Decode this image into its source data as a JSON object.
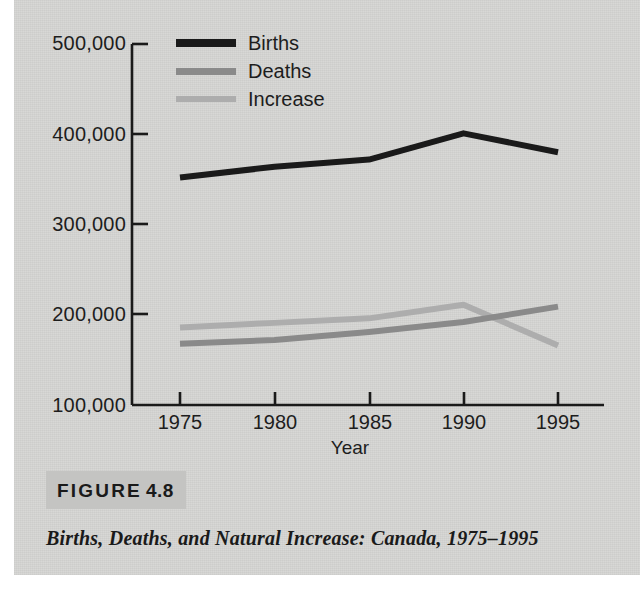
{
  "figure": {
    "tag_word": "FIGURE",
    "tag_number": "4.8",
    "caption": "Births, Deaths, and Natural Increase: Canada, 1975–1995"
  },
  "chart_data": {
    "type": "line",
    "title": "",
    "xlabel": "Year",
    "ylabel": "",
    "x": [
      1975,
      1980,
      1985,
      1990,
      1995
    ],
    "xtick_labels": [
      "1975",
      "1980",
      "1985",
      "1990",
      "1995"
    ],
    "ytick_labels": [
      "500,000",
      "400,000",
      "300,000",
      "200,000",
      "100,000"
    ],
    "ytick_values": [
      500000,
      400000,
      300000,
      200000,
      100000
    ],
    "ylim": [
      100000,
      500000
    ],
    "xlim": [
      1975,
      1995
    ],
    "grid": false,
    "legend_position": "top-center",
    "series": [
      {
        "name": "Births",
        "color": "#1a1a1a",
        "values": [
          352000,
          364000,
          372000,
          401000,
          380000
        ]
      },
      {
        "name": "Deaths",
        "color": "#8a8a8a",
        "values": [
          168000,
          172000,
          181000,
          192000,
          209000
        ]
      },
      {
        "name": "Increase",
        "color": "#adadad",
        "values": [
          186000,
          191000,
          196000,
          211000,
          166000
        ]
      }
    ]
  },
  "colors": {
    "page_background": "#d6d6d4",
    "axis": "#1a1a1a",
    "text": "#1d1d1d",
    "figure_tag_box": "#c4c4c2"
  }
}
